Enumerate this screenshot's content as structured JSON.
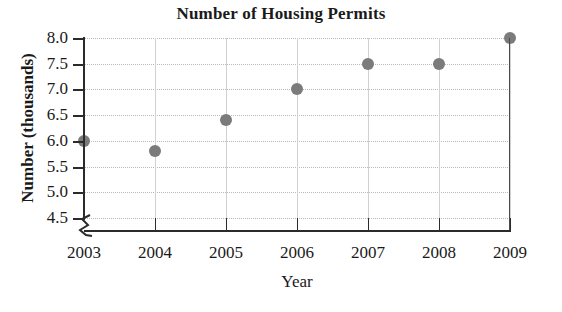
{
  "chart_data": {
    "type": "scatter",
    "title": "Number of Housing Permits",
    "xlabel": "Year",
    "ylabel": "Number (thousands)",
    "categories": [
      "2003",
      "2004",
      "2005",
      "2006",
      "2007",
      "2008",
      "2009"
    ],
    "x": [
      2003,
      2004,
      2005,
      2006,
      2007,
      2008,
      2009
    ],
    "values": [
      6.0,
      5.8,
      6.4,
      7.0,
      7.5,
      7.5,
      8.0
    ],
    "series": [
      {
        "name": "Number of Housing Permits",
        "values": [
          6.0,
          5.8,
          6.4,
          7.0,
          7.5,
          7.5,
          8.0
        ]
      }
    ],
    "ylim": [
      4.5,
      8.0
    ],
    "xlim": [
      2003,
      2009
    ],
    "y_ticks": [
      "8.0",
      "7.5",
      "7.0",
      "6.5",
      "6.0",
      "5.5",
      "5.0",
      "4.5"
    ],
    "y_tick_values": [
      8.0,
      7.5,
      7.0,
      6.5,
      6.0,
      5.5,
      5.0,
      4.5
    ],
    "x_ticks": [
      "2003",
      "2004",
      "2005",
      "2006",
      "2007",
      "2008",
      "2009"
    ],
    "grid": true,
    "legend": false,
    "axis_break": true,
    "marker_color": "#7b7b7b",
    "axis_color": "#2b2b2b",
    "grid_color": "#b9b9b9",
    "text_color": "#1a1a1a",
    "background_color": "#ffffff"
  },
  "axis_break_label": "y-axis-break"
}
